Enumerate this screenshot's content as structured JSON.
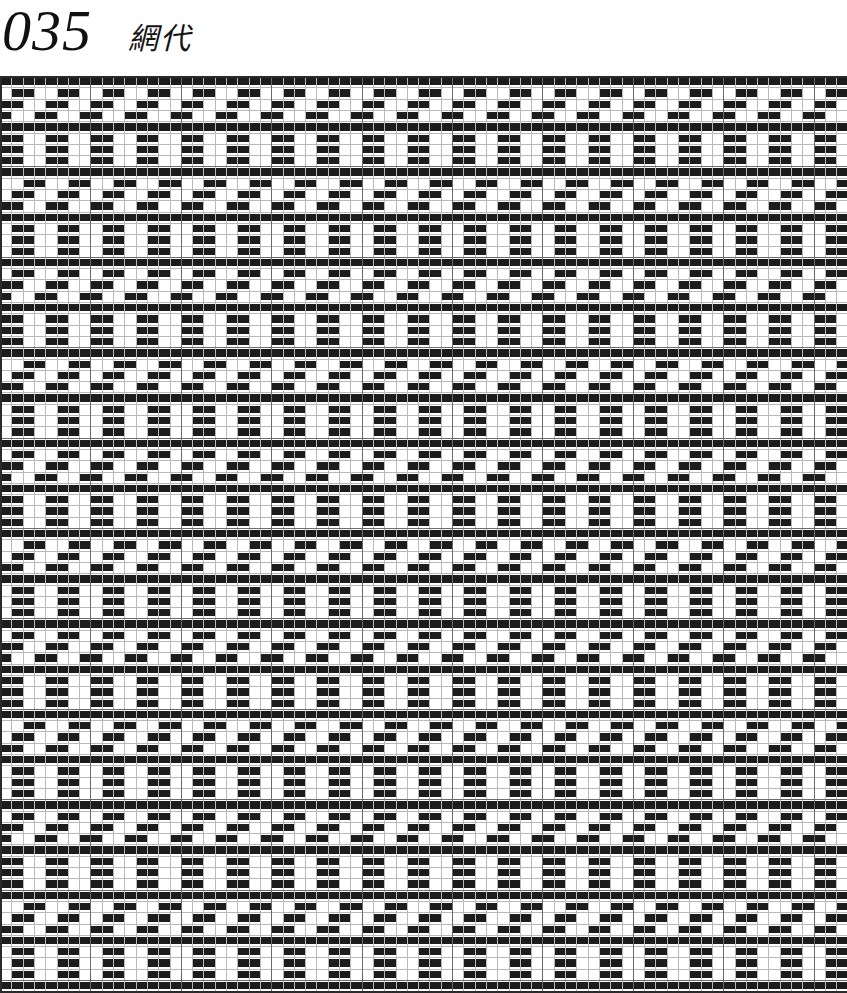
{
  "page": {
    "background_color": "#ffffff",
    "width": 847,
    "height": 993
  },
  "header": {
    "plate_number": "035",
    "plate_title": "網代",
    "title_romaji_note": "ajiro"
  },
  "draft": {
    "caption": "Weave draft grid",
    "columns": 75,
    "rows": 81,
    "cell_width": 11.3,
    "cell_height": 11.3,
    "origin_x": 0,
    "origin_y": 76,
    "fill_color": "#1c1c1c",
    "empty_color": "#ffffff",
    "grid_line_color": "#b9b9b9",
    "major_grid_line_color": "#6a6a6a",
    "border_color": "#2a2a2a",
    "major_every": 8,
    "pattern_name": "ajiro",
    "pattern_type": "broken-twill-basket",
    "block_size": 4,
    "block_period": 8,
    "notes": "Filled cells appear as horizontal runs of 3-8 cells forming interlocking diagonal basket-weave bands."
  },
  "chart_data": {
    "type": "heatmap",
    "title": "035 網代",
    "xlabel": "",
    "ylabel": "",
    "columns": 75,
    "rows": 81,
    "values_legend": {
      "0": "warp (white)",
      "1": "weft (black)"
    },
    "generator": {
      "kind": "ajiro-twill",
      "block": 4,
      "period": 8,
      "rule": "cell(r,c)=1 when ((floor(r/4)+floor(c/4)) mod 2 == 0) XOR (((r + c) mod 8) < 4) with row-phase shift of +2 every 8 rows"
    }
  }
}
